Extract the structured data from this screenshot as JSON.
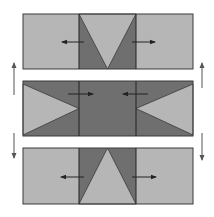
{
  "diagram": {
    "colors": {
      "light": "#b6b6b6",
      "dark": "#6f6f6f",
      "stroke": "#3a3a3a",
      "arrow": "#222222",
      "side_arrow": "#555555"
    },
    "panels": [
      {
        "id": "top",
        "x": 23,
        "y": 14,
        "w": 170,
        "h": 55,
        "div1": 79,
        "div2": 136,
        "shape": "inverted-triangle",
        "arrows": [
          {
            "x1": 84,
            "x2": 62,
            "y": 42,
            "dir": "left"
          },
          {
            "x1": 132,
            "x2": 155,
            "y": 42,
            "dir": "right"
          }
        ]
      },
      {
        "id": "middle",
        "x": 23,
        "y": 81,
        "w": 170,
        "h": 55,
        "div1": 79,
        "div2": 136,
        "shape": "side-triangles",
        "arrows": [
          {
            "x1": 68,
            "x2": 93,
            "y": 94,
            "dir": "right"
          },
          {
            "x1": 148,
            "x2": 123,
            "y": 94,
            "dir": "left"
          }
        ]
      },
      {
        "id": "bottom",
        "x": 23,
        "y": 148,
        "w": 170,
        "h": 56,
        "div1": 79,
        "div2": 136,
        "shape": "upright-triangle",
        "arrows": [
          {
            "x1": 84,
            "x2": 61,
            "y": 177,
            "dir": "left"
          },
          {
            "x1": 132,
            "x2": 156,
            "y": 177,
            "dir": "right"
          }
        ]
      }
    ],
    "side_arrows": [
      {
        "x": 14,
        "y1": 95,
        "y2": 63,
        "dir": "up"
      },
      {
        "x": 202,
        "y1": 88,
        "y2": 63,
        "dir": "up"
      },
      {
        "x": 14,
        "y1": 133,
        "y2": 158,
        "dir": "down"
      },
      {
        "x": 202,
        "y1": 133,
        "y2": 160,
        "dir": "down"
      }
    ]
  }
}
